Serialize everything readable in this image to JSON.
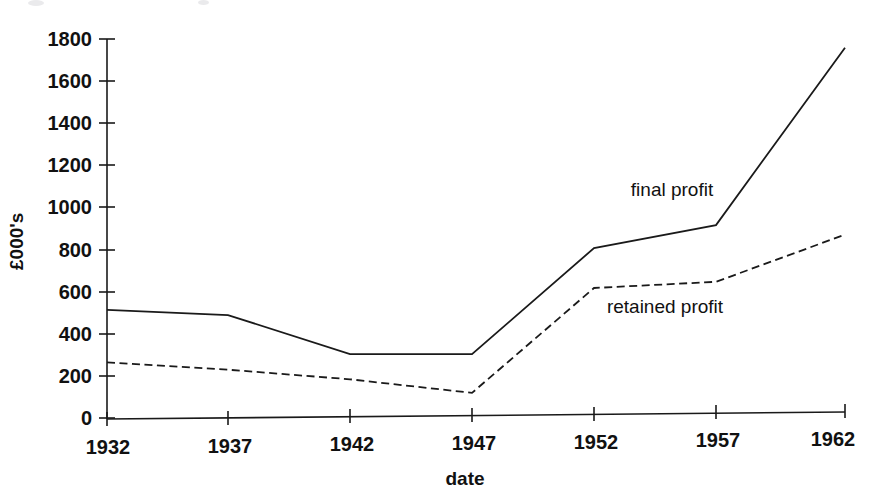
{
  "chart_data": {
    "type": "line",
    "title": "",
    "subtitle": "",
    "xlabel": "date",
    "ylabel": "£000's",
    "x": [
      1932,
      1937,
      1942,
      1947,
      1952,
      1957,
      1962
    ],
    "categories": [
      "1932",
      "1937",
      "1942",
      "1947",
      "1952",
      "1957",
      "1962"
    ],
    "xlim": [
      1932,
      1962
    ],
    "ylim": [
      0,
      1800
    ],
    "ytick_values": [
      0,
      200,
      400,
      600,
      800,
      1000,
      1200,
      1400,
      1600,
      1800
    ],
    "ytick_labels": [
      "0",
      "200",
      "400",
      "600",
      "800",
      "1000",
      "1200",
      "1400",
      "1600",
      "1800"
    ],
    "xtick_labels": [
      "1932",
      "1937",
      "1942",
      "1947",
      "1952",
      "1957",
      "1962"
    ],
    "grid": false,
    "legend_position": "inline-annotations",
    "series": [
      {
        "name": "final profit",
        "style": "solid",
        "color": "#1a1a1a",
        "values": [
          520,
          490,
          295,
          290,
          790,
          890,
          1730
        ]
      },
      {
        "name": "retained profit",
        "style": "dashed",
        "color": "#1a1a1a",
        "values": [
          270,
          230,
          175,
          105,
          600,
          620,
          840
        ]
      }
    ],
    "annotations": [
      {
        "text": "final profit",
        "x": 1957,
        "y": 1130
      },
      {
        "text": "retained profit",
        "x": 1955,
        "y": 570
      }
    ]
  },
  "axes": {
    "y_axis_name": "y-axis",
    "x_axis_name": "x-axis"
  }
}
